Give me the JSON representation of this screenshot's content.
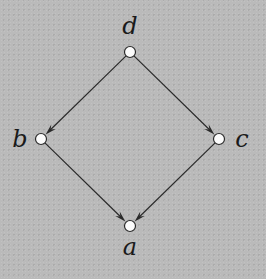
{
  "diagram": {
    "type": "directed-graph",
    "nodes": [
      {
        "id": "d",
        "label": "d"
      },
      {
        "id": "b",
        "label": "b"
      },
      {
        "id": "c",
        "label": "c"
      },
      {
        "id": "a",
        "label": "a"
      }
    ],
    "edges": [
      {
        "from": "d",
        "to": "b"
      },
      {
        "from": "d",
        "to": "c"
      },
      {
        "from": "b",
        "to": "a"
      },
      {
        "from": "c",
        "to": "a"
      }
    ],
    "colors": {
      "background": "#bababa",
      "node_fill": "#fbfbfb",
      "stroke": "#2a2a2a"
    }
  }
}
